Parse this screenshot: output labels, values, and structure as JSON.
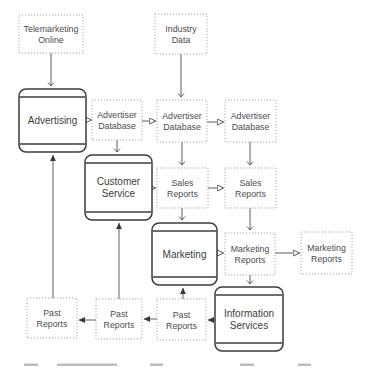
{
  "diagram": {
    "colors": {
      "background": "#ffffff",
      "process_border": "#3c3c3c",
      "data_border": "#a6a6a6",
      "edge_line": "#5f5f5f",
      "process_text": "#3d3d3d",
      "data_text": "#4c4c4c",
      "caption_remnant": "#bdbdbd"
    },
    "nodes": [
      {
        "id": "telemarketing-online",
        "type": "data",
        "label": "Telemarketing Online",
        "lines": [
          "Telemarketing",
          "Online"
        ],
        "x": 19,
        "y": 15,
        "w": 64,
        "h": 38
      },
      {
        "id": "industry-data",
        "type": "data",
        "label": "Industry Data",
        "lines": [
          "Industry",
          "Data"
        ],
        "x": 155,
        "y": 14,
        "w": 52,
        "h": 40
      },
      {
        "id": "advertising",
        "type": "process",
        "label": "Advertising",
        "lines": [
          "Advertising"
        ],
        "x": 19,
        "y": 89,
        "w": 67,
        "h": 63
      },
      {
        "id": "advertiser-database-1",
        "type": "data",
        "label": "Advertiser Database",
        "lines": [
          "Advertiser",
          "Database"
        ],
        "x": 92,
        "y": 100,
        "w": 50,
        "h": 40
      },
      {
        "id": "advertiser-database-2",
        "type": "data",
        "label": "Advertiser Database",
        "lines": [
          "Advertiser",
          "Database"
        ],
        "x": 157,
        "y": 100,
        "w": 50,
        "h": 42
      },
      {
        "id": "advertiser-database-3",
        "type": "data",
        "label": "Advertiser Database",
        "lines": [
          "Advertiser",
          "Database"
        ],
        "x": 225,
        "y": 100,
        "w": 51,
        "h": 42
      },
      {
        "id": "customer-service",
        "type": "process",
        "label": "Customer Service",
        "lines": [
          "Customer",
          "Service"
        ],
        "x": 85,
        "y": 155,
        "w": 67,
        "h": 65
      },
      {
        "id": "sales-reports-1",
        "type": "data",
        "label": "Sales Reports",
        "lines": [
          "Sales",
          "Reports"
        ],
        "x": 157,
        "y": 168,
        "w": 51,
        "h": 40
      },
      {
        "id": "sales-reports-2",
        "type": "data",
        "label": "Sales Reports",
        "lines": [
          "Sales",
          "Reports"
        ],
        "x": 225,
        "y": 168,
        "w": 51,
        "h": 40
      },
      {
        "id": "marketing",
        "type": "process",
        "label": "Marketing",
        "lines": [
          "Marketing"
        ],
        "x": 152,
        "y": 223,
        "w": 65,
        "h": 62
      },
      {
        "id": "marketing-reports-1",
        "type": "data",
        "label": "Marketing Reports",
        "lines": [
          "Marketing",
          "Reports"
        ],
        "x": 225,
        "y": 233,
        "w": 50,
        "h": 42
      },
      {
        "id": "marketing-reports-2",
        "type": "data",
        "label": "Marketing Reports",
        "lines": [
          "Marketing",
          "Reports"
        ],
        "x": 301,
        "y": 232,
        "w": 51,
        "h": 42
      },
      {
        "id": "information-services",
        "type": "process",
        "label": "Information Services",
        "lines": [
          "Information",
          "Services"
        ],
        "x": 215,
        "y": 287,
        "w": 68,
        "h": 64
      },
      {
        "id": "past-reports-1",
        "type": "data",
        "label": "Past Reports",
        "lines": [
          "Past",
          "Reports"
        ],
        "x": 27,
        "y": 298,
        "w": 50,
        "h": 40
      },
      {
        "id": "past-reports-2",
        "type": "data",
        "label": "Past Reports",
        "lines": [
          "Past",
          "Reports"
        ],
        "x": 96,
        "y": 299,
        "w": 46,
        "h": 40
      },
      {
        "id": "past-reports-3",
        "type": "data",
        "label": "Past Reports",
        "lines": [
          "Past",
          "Reports"
        ],
        "x": 157,
        "y": 299,
        "w": 49,
        "h": 41
      }
    ],
    "edges": [
      {
        "from": "telemarketing-online",
        "to": "advertising",
        "x1": 51,
        "y1": 53,
        "x2": 51,
        "y2": 86,
        "marker": "vee"
      },
      {
        "from": "industry-data",
        "to": "advertiser-database-2",
        "x1": 181,
        "y1": 54,
        "x2": 181,
        "y2": 97,
        "marker": "vee"
      },
      {
        "from": "advertising",
        "to": "advertiser-database-1",
        "x1": 86,
        "y1": 120,
        "x2": 91,
        "y2": 120,
        "marker": "open"
      },
      {
        "from": "advertiser-database-1",
        "to": "advertiser-database-2",
        "x1": 142,
        "y1": 121,
        "x2": 155,
        "y2": 121,
        "marker": "open"
      },
      {
        "from": "advertiser-database-2",
        "to": "advertiser-database-3",
        "x1": 207,
        "y1": 122,
        "x2": 223,
        "y2": 122,
        "marker": "open"
      },
      {
        "from": "advertiser-database-1",
        "to": "customer-service",
        "x1": 117,
        "y1": 140,
        "x2": 117,
        "y2": 152,
        "marker": "vee"
      },
      {
        "from": "advertiser-database-2",
        "to": "sales-reports-1",
        "x1": 182,
        "y1": 142,
        "x2": 182,
        "y2": 165,
        "marker": "vee"
      },
      {
        "from": "advertiser-database-3",
        "to": "sales-reports-2",
        "x1": 250,
        "y1": 142,
        "x2": 250,
        "y2": 165,
        "marker": "vee"
      },
      {
        "from": "customer-service",
        "to": "sales-reports-1",
        "x1": 152,
        "y1": 188,
        "x2": 155,
        "y2": 188,
        "marker": "open"
      },
      {
        "from": "sales-reports-1",
        "to": "sales-reports-2",
        "x1": 208,
        "y1": 188,
        "x2": 223,
        "y2": 188,
        "marker": "open"
      },
      {
        "from": "sales-reports-1",
        "to": "marketing",
        "x1": 182,
        "y1": 208,
        "x2": 182,
        "y2": 220,
        "marker": "vee"
      },
      {
        "from": "sales-reports-2",
        "to": "marketing-reports-1",
        "x1": 250,
        "y1": 208,
        "x2": 250,
        "y2": 230,
        "marker": "vee"
      },
      {
        "from": "marketing",
        "to": "marketing-reports-1",
        "x1": 217,
        "y1": 253,
        "x2": 223,
        "y2": 253,
        "marker": "open"
      },
      {
        "from": "marketing-reports-1",
        "to": "marketing-reports-2",
        "x1": 275,
        "y1": 253,
        "x2": 299,
        "y2": 253,
        "marker": "open"
      },
      {
        "from": "marketing-reports-1",
        "to": "information-services",
        "x1": 250,
        "y1": 275,
        "x2": 284,
        "y2": 275,
        "marker": "vee",
        "x2v": 250,
        "y2v": 284
      },
      {
        "from": "information-services",
        "to": "past-reports-3",
        "x1": 215,
        "y1": 320,
        "x2": 208,
        "y2": 320,
        "marker": "solid"
      },
      {
        "from": "past-reports-3",
        "to": "past-reports-2",
        "x1": 157,
        "y1": 319,
        "x2": 144,
        "y2": 319,
        "marker": "solid"
      },
      {
        "from": "past-reports-2",
        "to": "past-reports-1",
        "x1": 96,
        "y1": 320,
        "x2": 79,
        "y2": 320,
        "marker": "solid"
      },
      {
        "from": "past-reports-3",
        "to": "marketing",
        "x1": 183,
        "y1": 299,
        "x2": 183,
        "y2": 288,
        "marker": "solid"
      },
      {
        "from": "past-reports-2",
        "to": "customer-service",
        "x1": 119,
        "y1": 299,
        "x2": 119,
        "y2": 223,
        "marker": "solid"
      },
      {
        "from": "past-reports-1",
        "to": "advertising",
        "x1": 53,
        "y1": 298,
        "x2": 53,
        "y2": 155,
        "marker": "solid"
      }
    ],
    "caption_fragments": [
      {
        "x": 24,
        "w": 14
      },
      {
        "x": 57,
        "w": 60
      },
      {
        "x": 150,
        "w": 13
      },
      {
        "x": 240,
        "w": 14
      },
      {
        "x": 298,
        "w": 13
      }
    ]
  }
}
